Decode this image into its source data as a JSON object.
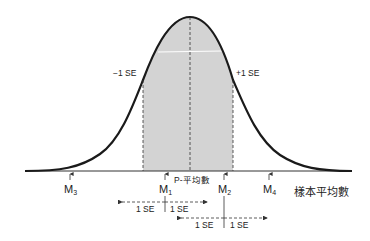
{
  "diagram": {
    "type": "normal-distribution-sampling",
    "colors": {
      "curve": "#1a1a1a",
      "shade": "#d3d3d3",
      "axis": "#333333",
      "dashes": "#333333",
      "text": "#222222"
    },
    "curve_labels": {
      "minus_se": "−1 SE",
      "plus_se": "+1 SE"
    },
    "center_label": "P-平均數",
    "axis_title": "樣本平均數",
    "sample_means": [
      {
        "id": "M3",
        "base": "M",
        "sub": "3"
      },
      {
        "id": "M1",
        "base": "M",
        "sub": "1"
      },
      {
        "id": "M2",
        "base": "M",
        "sub": "2"
      },
      {
        "id": "M4",
        "base": "M",
        "sub": "4"
      }
    ],
    "intervals": [
      {
        "for": "M1",
        "left_label": "1 SE",
        "right_label": "1 SE"
      },
      {
        "for": "M2",
        "left_label": "1 SE",
        "right_label": "1 SE"
      }
    ]
  }
}
